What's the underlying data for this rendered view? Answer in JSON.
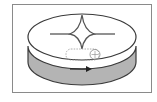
{
  "diagram": {
    "type": "network-device-icon",
    "shape": "cylinder-disc",
    "symbol": "four-point-star",
    "side_arrow": "right",
    "colors": {
      "frame_border": "#8a8a8a",
      "top_fill": "#ffffff",
      "side_fill": "#b4b4b4",
      "stroke": "#3a3a3a",
      "star": "#555555"
    }
  }
}
